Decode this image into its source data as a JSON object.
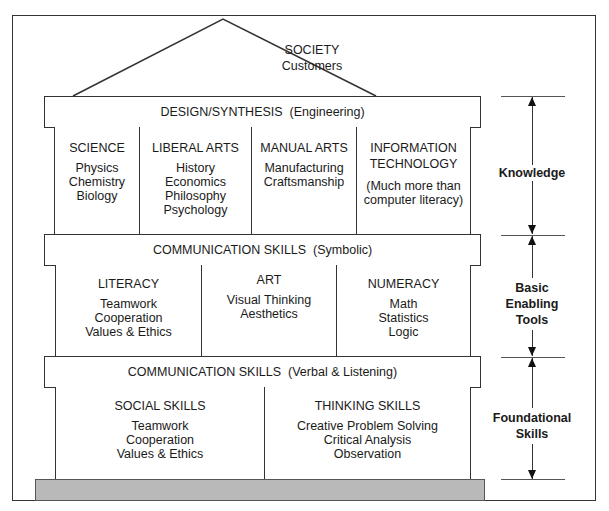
{
  "roof": {
    "title": "SOCIETY",
    "subtitle": "Customers"
  },
  "bars": {
    "design": "DESIGN/SYNTHESIS  (Engineering)",
    "symbolic": "COMMUNICATION SKILLS  (Symbolic)",
    "verbal": "COMMUNICATION SKILLS  (Verbal & Listening)"
  },
  "knowledge_columns": [
    {
      "head": "SCIENCE",
      "items": [
        "Physics",
        "Chemistry",
        "Biology"
      ]
    },
    {
      "head": "LIBERAL ARTS",
      "items": [
        "History",
        "Economics",
        "Philosophy",
        "Psychology"
      ]
    },
    {
      "head": "MANUAL ARTS",
      "items": [
        "Manufacturing",
        "Craftsmanship"
      ]
    },
    {
      "head": "INFORMATION TECHNOLOGY",
      "head_lines": [
        "INFORMATION",
        "TECHNOLOGY"
      ],
      "items": [
        "(Much more than",
        "computer literacy)"
      ]
    }
  ],
  "tools_columns": [
    {
      "head": "LITERACY",
      "items": [
        "Teamwork",
        "Cooperation",
        "Values & Ethics"
      ]
    },
    {
      "head": "ART",
      "items": [
        "Visual Thinking",
        "Aesthetics"
      ]
    },
    {
      "head": "NUMERACY",
      "items": [
        "Math",
        "Statistics",
        "Logic"
      ]
    }
  ],
  "foundation_columns": [
    {
      "head": "SOCIAL SKILLS",
      "items": [
        "Teamwork",
        "Cooperation",
        "Values & Ethics"
      ]
    },
    {
      "head": "THINKING SKILLS",
      "items": [
        "Creative Problem Solving",
        "Critical Analysis",
        "Observation"
      ]
    }
  ],
  "side_labels": {
    "knowledge": "Knowledge",
    "tools": [
      "Basic",
      "Enabling",
      "Tools"
    ],
    "foundational": [
      "Foundational",
      "Skills"
    ]
  },
  "colors": {
    "line": "#333333",
    "base_fill": "#b9b9b9"
  }
}
